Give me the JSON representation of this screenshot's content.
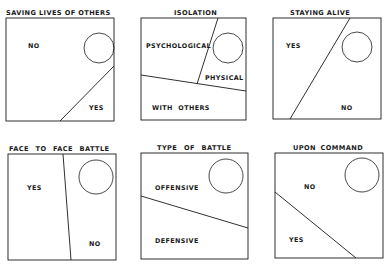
{
  "panels": [
    {
      "title": "SAVING LIVES OF OTHERS",
      "box": [
        6,
        18,
        114,
        121
      ],
      "dividers": [
        [
          60,
          121,
          114,
          66
        ]
      ],
      "circle": [
        99,
        48,
        15
      ],
      "labels": [
        {
          "text": "NO",
          "x": 28,
          "y": 42
        },
        {
          "text": "YES",
          "x": 89,
          "y": 104
        }
      ]
    },
    {
      "title": "ISOLATION",
      "box": [
        141,
        18,
        246,
        120
      ],
      "dividers": [
        [
          218,
          18,
          197,
          84
        ],
        [
          141,
          75,
          246,
          91
        ]
      ],
      "circle": [
        228,
        48,
        15
      ],
      "labels": [
        {
          "text": "PSYCHOLOGICAL",
          "x": 146,
          "y": 42
        },
        {
          "text": "PHYSICAL",
          "x": 205,
          "y": 74
        },
        {
          "text": "WITH OTHERS",
          "x": 152,
          "y": 104
        }
      ]
    },
    {
      "title": "STAYING ALIVE",
      "box": [
        273,
        18,
        381,
        119
      ],
      "dividers": [
        [
          350,
          18,
          290,
          119
        ]
      ],
      "circle": [
        357,
        47,
        15
      ],
      "labels": [
        {
          "text": "YES",
          "x": 286,
          "y": 42
        },
        {
          "text": "NO",
          "x": 341,
          "y": 104
        }
      ]
    },
    {
      "title": "FACE TO FACE BATTLE",
      "box": [
        8,
        154,
        116,
        260
      ],
      "dividers": [
        [
          63,
          154,
          71,
          260
        ]
      ],
      "circle": [
        96,
        177,
        17
      ],
      "labels": [
        {
          "text": "YES",
          "x": 27,
          "y": 184
        },
        {
          "text": "NO",
          "x": 89,
          "y": 240
        }
      ]
    },
    {
      "title": "TYPE OF BATTLE",
      "box": [
        141,
        153,
        248,
        259
      ],
      "dividers": [
        [
          141,
          196,
          248,
          228
        ]
      ],
      "circle": [
        226,
        176,
        17
      ],
      "labels": [
        {
          "text": "OFFENSIVE",
          "x": 155,
          "y": 184
        },
        {
          "text": "DEFENSIVE",
          "x": 155,
          "y": 237
        }
      ]
    },
    {
      "title": "UPON COMMAND",
      "box": [
        275,
        153,
        383,
        258
      ],
      "dividers": [
        [
          275,
          192,
          356,
          258
        ]
      ],
      "circle": [
        362,
        175,
        17
      ],
      "labels": [
        {
          "text": "NO",
          "x": 304,
          "y": 183
        },
        {
          "text": "YES",
          "x": 289,
          "y": 236
        }
      ]
    }
  ],
  "title_positions": [
    {
      "x": 6,
      "y": 9
    },
    {
      "x": 174,
      "y": 9
    },
    {
      "x": 290,
      "y": 9
    },
    {
      "x": 9,
      "y": 145
    },
    {
      "x": 157,
      "y": 144
    },
    {
      "x": 293,
      "y": 144
    }
  ],
  "colors": {
    "ink": "#1a1a1a",
    "paper": "#ffffff"
  }
}
